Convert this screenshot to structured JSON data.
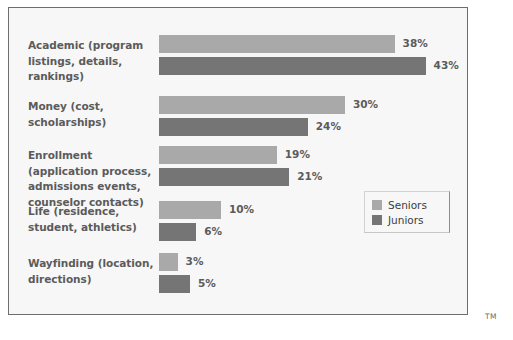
{
  "chart_data": {
    "type": "bar",
    "orientation": "horizontal",
    "title": "",
    "xlabel": "",
    "ylabel": "",
    "xlim": [
      0,
      50
    ],
    "grid": false,
    "value_suffix": "%",
    "legend_position": "middle-right",
    "categories": [
      "Academic (program listings, details, rankings)",
      "Money (cost, scholarships)",
      "Enrollment (application process, admissions events, counselor contacts)",
      "Life (residence, student, athletics)",
      "Wayfinding (location, directions)"
    ],
    "series": [
      {
        "name": "Seniors",
        "color": "#a9a9a9",
        "values": [
          38,
          30,
          19,
          10,
          3
        ]
      },
      {
        "name": "Juniors",
        "color": "#757575",
        "values": [
          43,
          24,
          21,
          6,
          5
        ]
      }
    ]
  },
  "rows": [
    {
      "label_lines": [
        "Academic (program",
        "listings, details,",
        "rankings)"
      ],
      "seniors_value": 38,
      "seniors_label": "38%",
      "juniors_value": 43,
      "juniors_label": "43%"
    },
    {
      "label_lines": [
        "Money (cost,",
        "scholarships)"
      ],
      "seniors_value": 30,
      "seniors_label": "30%",
      "juniors_value": 24,
      "juniors_label": "24%"
    },
    {
      "label_lines": [
        "Enrollment",
        "(application process,",
        "admissions events,",
        "counselor contacts)"
      ],
      "seniors_value": 19,
      "seniors_label": "19%",
      "juniors_value": 21,
      "juniors_label": "21%"
    },
    {
      "label_lines": [
        "Life (residence,",
        "student, athletics)"
      ],
      "seniors_value": 10,
      "seniors_label": "10%",
      "juniors_value": 6,
      "juniors_label": "6%"
    },
    {
      "label_lines": [
        "Wayfinding (location,",
        "directions)"
      ],
      "seniors_value": 3,
      "seniors_label": "3%",
      "juniors_value": 5,
      "juniors_label": "5%"
    }
  ],
  "legend": {
    "items": [
      {
        "label": "Seniors",
        "series": "seniors"
      },
      {
        "label": "Juniors",
        "series": "juniors"
      }
    ]
  },
  "marks": {
    "trademark": "TM"
  },
  "colors": {
    "seniors": "#a9a9a9",
    "juniors": "#757575",
    "label_text": "#5b5b5b",
    "legend_text": "#3d3d3d",
    "panel_background": "#f7f7f7",
    "panel_border": "#6d6d6d"
  }
}
